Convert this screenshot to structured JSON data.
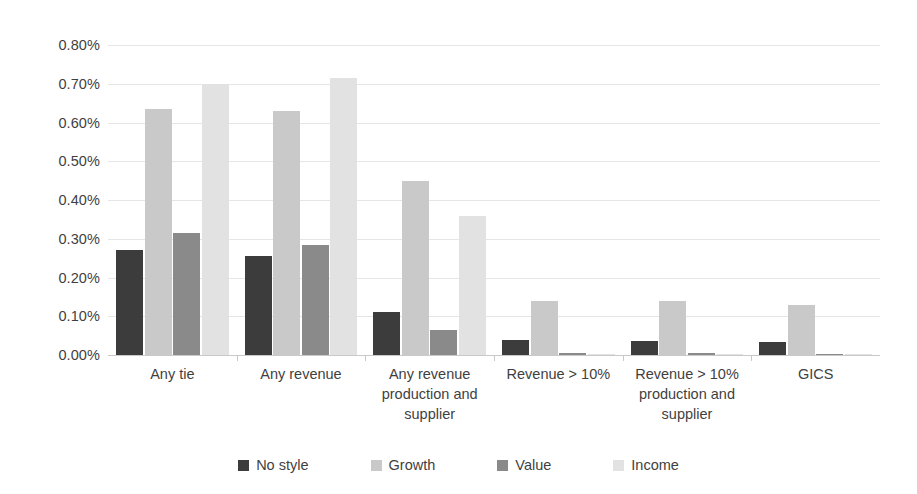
{
  "chart_data": {
    "type": "bar",
    "title": "",
    "xlabel": "",
    "ylabel": "",
    "ylim": [
      0,
      0.008
    ],
    "y_tick_labels": [
      "0.80%",
      "0.70%",
      "0.60%",
      "0.50%",
      "0.40%",
      "0.30%",
      "0.20%",
      "0.10%",
      "0.00%"
    ],
    "y_tick_values": [
      0.8,
      0.7,
      0.6,
      0.5,
      0.4,
      0.3,
      0.2,
      0.1,
      0.0
    ],
    "y_unit": "%",
    "grid": true,
    "legend_position": "bottom",
    "categories": [
      "Any tie",
      "Any revenue",
      "Any revenue production and supplier",
      "Revenue > 10%",
      "Revenue > 10% production and supplier",
      "GICS"
    ],
    "category_lines": [
      [
        "Any tie"
      ],
      [
        "Any revenue"
      ],
      [
        "Any revenue",
        "production and",
        "supplier"
      ],
      [
        "Revenue > 10%"
      ],
      [
        "Revenue > 10%",
        "production and",
        "supplier"
      ],
      [
        "GICS"
      ]
    ],
    "series": [
      {
        "name": "No style",
        "color": "#3c3c3c",
        "values": [
          0.27,
          0.255,
          0.11,
          0.04,
          0.037,
          0.033
        ]
      },
      {
        "name": "Growth",
        "color": "#c9c9c9",
        "values": [
          0.635,
          0.63,
          0.45,
          0.14,
          0.14,
          0.13
        ]
      },
      {
        "name": "Value",
        "color": "#8a8a8a",
        "values": [
          0.315,
          0.285,
          0.065,
          0.005,
          0.004,
          0.003
        ]
      },
      {
        "name": "Income",
        "color": "#e2e2e2",
        "values": [
          0.7,
          0.715,
          0.36,
          0.002,
          0.002,
          0.002
        ]
      }
    ]
  },
  "legend": {
    "items": [
      {
        "label": "No style",
        "color": "#3c3c3c"
      },
      {
        "label": "Growth",
        "color": "#c9c9c9"
      },
      {
        "label": "Value",
        "color": "#8a8a8a"
      },
      {
        "label": "Income",
        "color": "#e2e2e2"
      }
    ]
  },
  "colors": {
    "gridline": "#e6e6e6",
    "axis": "#c9c9c9",
    "text": "#3f3f3f",
    "background": "#ffffff"
  }
}
